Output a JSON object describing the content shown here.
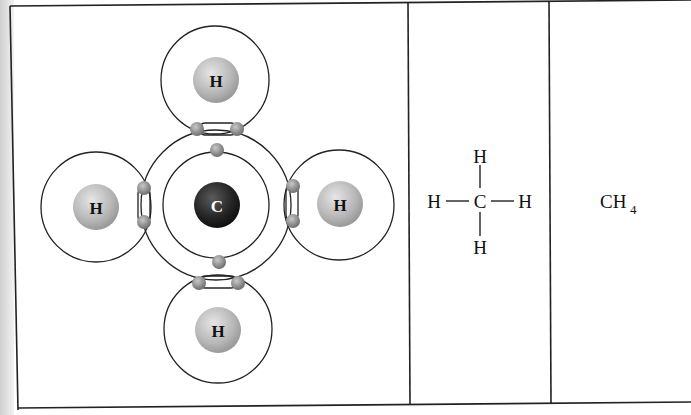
{
  "diagram": {
    "panels": [
      {
        "name": "electron-shell-model",
        "nucleus_center": "C",
        "outer_atoms": [
          "H",
          "H",
          "H",
          "H"
        ]
      },
      {
        "name": "structural-formula",
        "center": "C",
        "top": "H",
        "left": "H",
        "right": "H",
        "bottom": "H",
        "bond": "—"
      },
      {
        "name": "molecular-formula",
        "base": "CH",
        "subscript": "4"
      }
    ],
    "colors": {
      "line": "#222222",
      "carbon": "#2a2a2a",
      "hydrogen": "#b8b8b8",
      "electron": "#8a8a8a"
    }
  }
}
